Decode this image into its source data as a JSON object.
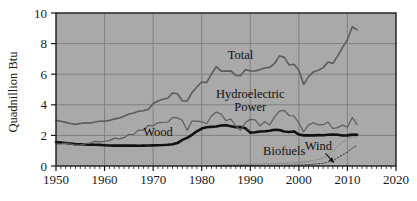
{
  "chart_data": {
    "type": "line",
    "title": "",
    "xlabel": "",
    "ylabel": "Quadnillion Btu",
    "xlim": [
      1950,
      2020
    ],
    "ylim": [
      0,
      10
    ],
    "xticks": [
      1950,
      1960,
      1970,
      1980,
      1990,
      2000,
      2010,
      2020
    ],
    "yticks": [
      0,
      2,
      4,
      6,
      8,
      10
    ],
    "xtick_labels": [
      "1950",
      "1960",
      "1970",
      "1980",
      "1990",
      "2000",
      "2010",
      "2020"
    ],
    "ytick_labels": [
      "0",
      "2",
      "4",
      "6",
      "8",
      "10"
    ],
    "xminor_tick_step": 1,
    "grid": true,
    "grid_axes": "both",
    "plot_background": "#a9a9a9",
    "figure_background": "#ffffff",
    "axis_color": "#1a1a1a",
    "grid_color": "#7d7d7d",
    "legend_position": "inline-annotations",
    "series": [
      {
        "name": "Total",
        "label": "Total",
        "color": "#5c5c5c",
        "linewidth": 1.6,
        "linestyle": "solid",
        "label_x": 1988,
        "label_y": 7.0,
        "x": [
          1950,
          1951,
          1952,
          1953,
          1954,
          1955,
          1956,
          1957,
          1958,
          1959,
          1960,
          1961,
          1962,
          1963,
          1964,
          1965,
          1966,
          1967,
          1968,
          1969,
          1970,
          1971,
          1972,
          1973,
          1974,
          1975,
          1976,
          1977,
          1978,
          1979,
          1980,
          1981,
          1982,
          1983,
          1984,
          1985,
          1986,
          1987,
          1988,
          1989,
          1990,
          1991,
          1992,
          1993,
          1994,
          1995,
          1996,
          1997,
          1998,
          1999,
          2000,
          2001,
          2002,
          2003,
          2004,
          2005,
          2006,
          2007,
          2008,
          2009,
          2010,
          2011,
          2012
        ],
        "values": [
          2.98,
          2.92,
          2.85,
          2.78,
          2.72,
          2.78,
          2.83,
          2.8,
          2.88,
          2.92,
          2.93,
          2.98,
          3.08,
          3.13,
          3.25,
          3.4,
          3.47,
          3.58,
          3.61,
          3.7,
          4.08,
          4.25,
          4.36,
          4.43,
          4.77,
          4.72,
          4.25,
          4.25,
          4.8,
          5.17,
          5.49,
          5.45,
          6.0,
          6.5,
          6.2,
          6.2,
          6.22,
          5.92,
          5.9,
          6.3,
          6.21,
          6.21,
          6.3,
          6.4,
          6.45,
          6.7,
          7.2,
          7.1,
          6.6,
          6.65,
          6.26,
          5.33,
          5.84,
          6.15,
          6.26,
          6.43,
          6.8,
          6.7,
          7.2,
          7.75,
          8.25,
          9.1,
          8.9
        ]
      },
      {
        "name": "Wood",
        "label": "Wood",
        "color": "#111111",
        "linewidth": 2.6,
        "linestyle": "solid",
        "label_x": 1971,
        "label_y": 1.95,
        "x": [
          1950,
          1951,
          1952,
          1953,
          1954,
          1955,
          1956,
          1957,
          1958,
          1959,
          1960,
          1961,
          1962,
          1963,
          1964,
          1965,
          1966,
          1967,
          1968,
          1969,
          1970,
          1971,
          1972,
          1973,
          1974,
          1975,
          1976,
          1977,
          1978,
          1979,
          1980,
          1981,
          1982,
          1983,
          1984,
          1985,
          1986,
          1987,
          1988,
          1989,
          1990,
          1991,
          1992,
          1993,
          1994,
          1995,
          1996,
          1997,
          1998,
          1999,
          2000,
          2001,
          2002,
          2003,
          2004,
          2005,
          2006,
          2007,
          2008,
          2009,
          2010,
          2011,
          2012
        ],
        "values": [
          1.56,
          1.53,
          1.5,
          1.47,
          1.43,
          1.42,
          1.41,
          1.4,
          1.39,
          1.38,
          1.36,
          1.34,
          1.33,
          1.33,
          1.33,
          1.34,
          1.33,
          1.32,
          1.33,
          1.34,
          1.35,
          1.36,
          1.37,
          1.39,
          1.42,
          1.5,
          1.71,
          1.84,
          2.04,
          2.27,
          2.45,
          2.53,
          2.56,
          2.58,
          2.65,
          2.67,
          2.6,
          2.54,
          2.55,
          2.46,
          2.18,
          2.21,
          2.25,
          2.27,
          2.3,
          2.37,
          2.35,
          2.25,
          2.22,
          2.26,
          2.06,
          2.0,
          2.01,
          2.0,
          2.02,
          2.01,
          2.04,
          2.06,
          2.04,
          1.99,
          2.0,
          2.05,
          2.04
        ]
      },
      {
        "name": "Hydroelectric Power",
        "label": "Hydroelectric\nPower",
        "label_line1": "Hydroelectric",
        "label_line2": "Power",
        "color": "#5c5c5c",
        "linewidth": 1.2,
        "linestyle": "solid",
        "label_x": 1990,
        "label_y": 4.45,
        "x": [
          1950,
          1951,
          1952,
          1953,
          1954,
          1955,
          1956,
          1957,
          1958,
          1959,
          1960,
          1961,
          1962,
          1963,
          1964,
          1965,
          1966,
          1967,
          1968,
          1969,
          1970,
          1971,
          1972,
          1973,
          1974,
          1975,
          1976,
          1977,
          1978,
          1979,
          1980,
          1981,
          1982,
          1983,
          1984,
          1985,
          1986,
          1987,
          1988,
          1989,
          1990,
          1991,
          1992,
          1993,
          1994,
          1995,
          1996,
          1997,
          1998,
          1999,
          2000,
          2001,
          2002,
          2003,
          2004,
          2005,
          2006,
          2007,
          2008,
          2009,
          2010,
          2011,
          2012
        ],
        "values": [
          1.42,
          1.45,
          1.5,
          1.44,
          1.36,
          1.36,
          1.46,
          1.5,
          1.61,
          1.59,
          1.61,
          1.66,
          1.82,
          1.77,
          1.85,
          2.06,
          2.07,
          2.35,
          2.34,
          2.65,
          2.63,
          2.82,
          2.86,
          2.86,
          3.18,
          3.15,
          2.98,
          2.33,
          2.94,
          2.93,
          2.9,
          2.76,
          3.27,
          3.53,
          3.39,
          2.97,
          3.07,
          2.63,
          2.33,
          2.84,
          3.05,
          3.02,
          2.62,
          2.89,
          2.68,
          3.21,
          3.59,
          3.64,
          3.3,
          3.27,
          2.81,
          2.24,
          2.69,
          2.83,
          2.69,
          2.7,
          2.87,
          2.45,
          2.51,
          2.67,
          2.54,
          3.17,
          2.7
        ]
      },
      {
        "name": "Biofuels",
        "label": "Biofuels",
        "color": "#8a8a8a",
        "linewidth": 1.0,
        "linestyle": "solid",
        "label_x": 1997,
        "label_y": 0.7,
        "x": [
          1981,
          1984,
          1987,
          1990,
          1993,
          1996,
          1999,
          2001,
          2003,
          2005,
          2006,
          2007,
          2008,
          2009,
          2010,
          2011,
          2012
        ],
        "values": [
          0.0,
          0.05,
          0.08,
          0.11,
          0.14,
          0.16,
          0.21,
          0.25,
          0.35,
          0.52,
          0.72,
          0.96,
          1.3,
          1.55,
          1.75,
          1.9,
          1.9
        ]
      },
      {
        "name": "Wind",
        "label": "Wind",
        "color": "#3a3a3a",
        "linewidth": 1.0,
        "linestyle": "dotted",
        "label_x": 2004,
        "label_y": 1.05,
        "arrow_from": [
          2005.5,
          0.82
        ],
        "arrow_to": [
          2007.2,
          0.22
        ],
        "x": [
          1983,
          1986,
          1989,
          1992,
          1995,
          1998,
          2001,
          2003,
          2005,
          2006,
          2007,
          2008,
          2009,
          2010,
          2011,
          2012
        ],
        "values": [
          0.0,
          0.01,
          0.02,
          0.03,
          0.03,
          0.05,
          0.07,
          0.12,
          0.18,
          0.26,
          0.34,
          0.55,
          0.72,
          0.92,
          1.17,
          1.34
        ]
      }
    ]
  }
}
